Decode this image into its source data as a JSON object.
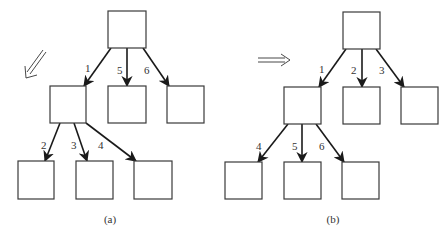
{
  "diagram": {
    "type": "tree-traversal-order-comparison",
    "panels": [
      {
        "id": "a",
        "caption": "(a)",
        "traversal": "depth-first",
        "direction_icon": "double-arrow-down-left",
        "nodes": [
          {
            "id": "a_root",
            "x": 108,
            "y": 11,
            "w": 38,
            "h": 37
          },
          {
            "id": "a_m1",
            "x": 50,
            "y": 86,
            "w": 36,
            "h": 37
          },
          {
            "id": "a_m2",
            "x": 108,
            "y": 86,
            "w": 38,
            "h": 37
          },
          {
            "id": "a_m3",
            "x": 167,
            "y": 86,
            "w": 37,
            "h": 37
          },
          {
            "id": "a_b1",
            "x": 18,
            "y": 161,
            "w": 36,
            "h": 38
          },
          {
            "id": "a_b2",
            "x": 76,
            "y": 161,
            "w": 37,
            "h": 38
          },
          {
            "id": "a_b3",
            "x": 134,
            "y": 161,
            "w": 38,
            "h": 38
          }
        ],
        "edges": [
          {
            "label": "1",
            "x1": 111,
            "y1": 48,
            "x2": 84,
            "y2": 86,
            "lx": 85,
            "ly": 72
          },
          {
            "label": "5",
            "x1": 127,
            "y1": 48,
            "x2": 127,
            "y2": 86,
            "lx": 117,
            "ly": 74
          },
          {
            "label": "6",
            "x1": 143,
            "y1": 48,
            "x2": 169,
            "y2": 86,
            "lx": 144,
            "ly": 74
          },
          {
            "label": "2",
            "x1": 60,
            "y1": 123,
            "x2": 45,
            "y2": 161,
            "lx": 41,
            "ly": 149
          },
          {
            "label": "3",
            "x1": 74,
            "y1": 123,
            "x2": 87,
            "y2": 161,
            "lx": 71,
            "ly": 149
          },
          {
            "label": "4",
            "x1": 86,
            "y1": 123,
            "x2": 136,
            "y2": 161,
            "lx": 98,
            "ly": 149
          }
        ]
      },
      {
        "id": "b",
        "caption": "(b)",
        "traversal": "breadth-first",
        "direction_icon": "double-arrow-right",
        "nodes": [
          {
            "id": "b_root",
            "x": 343,
            "y": 12,
            "w": 37,
            "h": 37
          },
          {
            "id": "b_m1",
            "x": 284,
            "y": 87,
            "w": 37,
            "h": 37
          },
          {
            "id": "b_m2",
            "x": 343,
            "y": 87,
            "w": 37,
            "h": 37
          },
          {
            "id": "b_m3",
            "x": 401,
            "y": 87,
            "w": 37,
            "h": 37
          },
          {
            "id": "b_b1",
            "x": 225,
            "y": 162,
            "w": 37,
            "h": 37
          },
          {
            "id": "b_b2",
            "x": 284,
            "y": 162,
            "w": 37,
            "h": 37
          },
          {
            "id": "b_b3",
            "x": 342,
            "y": 162,
            "w": 37,
            "h": 37
          }
        ],
        "edges": [
          {
            "label": "1",
            "x1": 346,
            "y1": 49,
            "x2": 319,
            "y2": 87,
            "lx": 319,
            "ly": 73
          },
          {
            "label": "2",
            "x1": 362,
            "y1": 49,
            "x2": 362,
            "y2": 87,
            "lx": 351,
            "ly": 74
          },
          {
            "label": "3",
            "x1": 376,
            "y1": 49,
            "x2": 404,
            "y2": 87,
            "lx": 379,
            "ly": 74
          },
          {
            "label": "4",
            "x1": 288,
            "y1": 124,
            "x2": 258,
            "y2": 162,
            "lx": 256,
            "ly": 150
          },
          {
            "label": "5",
            "x1": 302,
            "y1": 124,
            "x2": 302,
            "y2": 162,
            "lx": 292,
            "ly": 150
          },
          {
            "label": "6",
            "x1": 316,
            "y1": 124,
            "x2": 344,
            "y2": 162,
            "lx": 319,
            "ly": 150
          }
        ]
      }
    ]
  },
  "captions": {
    "a": "(a)",
    "b": "(b)"
  }
}
